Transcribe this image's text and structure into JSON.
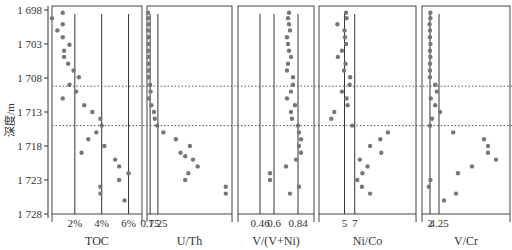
{
  "chart_data": {
    "type": "scatter",
    "ylabel": "深度/m",
    "y_ticks": [
      1698,
      1703,
      1708,
      1713,
      1718,
      1723,
      1728
    ],
    "y_tick_labels": [
      "1 698",
      "1 703",
      "1 708",
      "1 713",
      "1 718",
      "1 723",
      "1 728"
    ],
    "ylim": [
      1697.5,
      1728
    ],
    "y_inverted": true,
    "boundary_lines_depth": [
      1709.2,
      1715.0
    ],
    "depths": [
      1698.4,
      1699.2,
      1700.1,
      1701.0,
      1702.0,
      1703.0,
      1704.1,
      1705.0,
      1705.9,
      1706.9,
      1707.9,
      1709.0,
      1710.0,
      1711.0,
      1712.0,
      1713.0,
      1714.0,
      1715.0,
      1716.0,
      1717.0,
      1718.0,
      1719.0,
      1720.0,
      1721.0,
      1722.0,
      1723.0,
      1724.0,
      1725.0,
      1726.0
    ],
    "panels": [
      {
        "name": "TOC",
        "title": "TOC",
        "ref_lines": [
          2,
          4,
          6
        ],
        "ref_labels": [
          "2%",
          "4%",
          "6%"
        ],
        "xlim": [
          0.3,
          7.0
        ],
        "points": [
          {
            "d": 1698.4,
            "v": 1.1
          },
          {
            "d": 1699.2,
            "v": 0.3
          },
          {
            "d": 1700.1,
            "v": 1.1
          },
          {
            "d": 1701.0,
            "v": 0.7
          },
          {
            "d": 1702.0,
            "v": 1.1
          },
          {
            "d": 1703.1,
            "v": 1.6
          },
          {
            "d": 1704.0,
            "v": 1.2
          },
          {
            "d": 1704.9,
            "v": 1.2
          },
          {
            "d": 1705.9,
            "v": 1.5
          },
          {
            "d": 1706.9,
            "v": 1.9
          },
          {
            "d": 1707.9,
            "v": 2.3
          },
          {
            "d": 1709.0,
            "v": 1.6
          },
          {
            "d": 1710.0,
            "v": 2.1
          },
          {
            "d": 1711.0,
            "v": 1.1
          },
          {
            "d": 1712.0,
            "v": 2.7
          },
          {
            "d": 1713.0,
            "v": 3.3
          },
          {
            "d": 1714.0,
            "v": 3.9
          },
          {
            "d": 1715.0,
            "v": 4.0
          },
          {
            "d": 1716.0,
            "v": 3.6
          },
          {
            "d": 1717.0,
            "v": 3.0
          },
          {
            "d": 1718.0,
            "v": 4.2
          },
          {
            "d": 1719.0,
            "v": 2.5
          },
          {
            "d": 1720.0,
            "v": 5.0
          },
          {
            "d": 1721.0,
            "v": 5.3
          },
          {
            "d": 1722.0,
            "v": 6.0
          },
          {
            "d": 1723.0,
            "v": 5.3
          },
          {
            "d": 1724.0,
            "v": 3.9
          },
          {
            "d": 1725.0,
            "v": 3.9
          },
          {
            "d": 1726.0,
            "v": 5.7
          }
        ]
      },
      {
        "name": "U/Th",
        "title": "U/Th",
        "ref_lines": [
          0.75,
          1.25
        ],
        "ref_labels": [
          "0.75",
          "1.25"
        ],
        "xlim": [
          0.55,
          6.0
        ],
        "points": [
          {
            "d": 1698.4,
            "v": 0.62
          },
          {
            "d": 1699.2,
            "v": 0.62
          },
          {
            "d": 1700.1,
            "v": 0.63
          },
          {
            "d": 1701.0,
            "v": 0.63
          },
          {
            "d": 1702.0,
            "v": 0.64
          },
          {
            "d": 1703.0,
            "v": 0.64
          },
          {
            "d": 1704.0,
            "v": 0.63
          },
          {
            "d": 1704.9,
            "v": 0.64
          },
          {
            "d": 1705.9,
            "v": 0.66
          },
          {
            "d": 1706.9,
            "v": 0.65
          },
          {
            "d": 1707.9,
            "v": 0.66
          },
          {
            "d": 1709.0,
            "v": 0.75
          },
          {
            "d": 1710.0,
            "v": 0.78
          },
          {
            "d": 1711.0,
            "v": 0.68
          },
          {
            "d": 1712.0,
            "v": 0.83
          },
          {
            "d": 1713.0,
            "v": 1.0
          },
          {
            "d": 1714.0,
            "v": 1.05
          },
          {
            "d": 1715.0,
            "v": 1.2
          },
          {
            "d": 1716.0,
            "v": 1.6
          },
          {
            "d": 1717.0,
            "v": 2.4
          },
          {
            "d": 1718.0,
            "v": 3.3
          },
          {
            "d": 1719.0,
            "v": 2.7
          },
          {
            "d": 1719.5,
            "v": 3.0
          },
          {
            "d": 1720.0,
            "v": 3.5
          },
          {
            "d": 1721.0,
            "v": 3.8
          },
          {
            "d": 1722.0,
            "v": 3.2
          },
          {
            "d": 1723.0,
            "v": 3.0
          },
          {
            "d": 1724.0,
            "v": 5.6
          },
          {
            "d": 1725.0,
            "v": 5.6
          }
        ]
      },
      {
        "name": "V/(V+Ni)",
        "title": "V/(V+Ni)",
        "ref_lines": [
          0.46,
          0.6,
          0.84
        ],
        "ref_labels": [
          "0.46",
          "0.6",
          "0.84"
        ],
        "xlim": [
          0.24,
          1.0
        ],
        "points": [
          {
            "d": 1698.4,
            "v": 0.75
          },
          {
            "d": 1699.2,
            "v": 0.74
          },
          {
            "d": 1700.1,
            "v": 0.75
          },
          {
            "d": 1701.0,
            "v": 0.76
          },
          {
            "d": 1702.0,
            "v": 0.73
          },
          {
            "d": 1703.0,
            "v": 0.74
          },
          {
            "d": 1704.0,
            "v": 0.75
          },
          {
            "d": 1704.9,
            "v": 0.77
          },
          {
            "d": 1705.9,
            "v": 0.74
          },
          {
            "d": 1706.9,
            "v": 0.73
          },
          {
            "d": 1707.9,
            "v": 0.79
          },
          {
            "d": 1709.0,
            "v": 0.79
          },
          {
            "d": 1710.0,
            "v": 0.77
          },
          {
            "d": 1711.0,
            "v": 0.73
          },
          {
            "d": 1712.0,
            "v": 0.81
          },
          {
            "d": 1713.0,
            "v": 0.77
          },
          {
            "d": 1714.0,
            "v": 0.78
          },
          {
            "d": 1715.0,
            "v": 0.84
          },
          {
            "d": 1716.0,
            "v": 0.85
          },
          {
            "d": 1717.0,
            "v": 0.87
          },
          {
            "d": 1718.0,
            "v": 0.85
          },
          {
            "d": 1719.0,
            "v": 0.87
          },
          {
            "d": 1720.0,
            "v": 0.82
          },
          {
            "d": 1721.0,
            "v": 0.72
          },
          {
            "d": 1722.0,
            "v": 0.56
          },
          {
            "d": 1723.0,
            "v": 0.56
          },
          {
            "d": 1724.0,
            "v": 0.85
          },
          {
            "d": 1725.0,
            "v": 0.76
          }
        ]
      },
      {
        "name": "Ni/Co",
        "title": "Ni/Co",
        "ref_lines": [
          5,
          7
        ],
        "ref_labels": [
          "5",
          "7"
        ],
        "xlim": [
          0,
          19
        ],
        "points": [
          {
            "d": 1698.4,
            "v": 5.3
          },
          {
            "d": 1699.2,
            "v": 5.4
          },
          {
            "d": 1700.1,
            "v": 3.6
          },
          {
            "d": 1701.0,
            "v": 5.0
          },
          {
            "d": 1702.0,
            "v": 5.1
          },
          {
            "d": 1703.0,
            "v": 5.3
          },
          {
            "d": 1704.0,
            "v": 4.5
          },
          {
            "d": 1704.9,
            "v": 3.7
          },
          {
            "d": 1705.9,
            "v": 5.2
          },
          {
            "d": 1706.9,
            "v": 4.9
          },
          {
            "d": 1707.9,
            "v": 6.1
          },
          {
            "d": 1709.0,
            "v": 6.0
          },
          {
            "d": 1710.0,
            "v": 4.5
          },
          {
            "d": 1711.0,
            "v": 5.4
          },
          {
            "d": 1712.0,
            "v": 5.6
          },
          {
            "d": 1713.0,
            "v": 3.0
          },
          {
            "d": 1714.0,
            "v": 2.4
          },
          {
            "d": 1715.0,
            "v": 6.5
          },
          {
            "d": 1716.0,
            "v": 13.5
          },
          {
            "d": 1717.0,
            "v": 12.0
          },
          {
            "d": 1718.0,
            "v": 10.0
          },
          {
            "d": 1719.0,
            "v": 12.2
          },
          {
            "d": 1720.0,
            "v": 8.0
          },
          {
            "d": 1721.0,
            "v": 9.5
          },
          {
            "d": 1722.0,
            "v": 8.5
          },
          {
            "d": 1723.0,
            "v": 7.5
          },
          {
            "d": 1724.0,
            "v": 8.4
          },
          {
            "d": 1725.0,
            "v": 10.0
          }
        ]
      },
      {
        "name": "V/Cr",
        "title": "V/Cr",
        "ref_lines": [
          2,
          4.25
        ],
        "ref_labels": [
          "2",
          "4.25"
        ],
        "xlim": [
          0,
          22
        ],
        "points": [
          {
            "d": 1698.4,
            "v": 2.1
          },
          {
            "d": 1699.2,
            "v": 2.1
          },
          {
            "d": 1700.1,
            "v": 1.9
          },
          {
            "d": 1701.0,
            "v": 2.0
          },
          {
            "d": 1702.0,
            "v": 2.0
          },
          {
            "d": 1703.0,
            "v": 2.1
          },
          {
            "d": 1704.0,
            "v": 2.0
          },
          {
            "d": 1704.9,
            "v": 2.1
          },
          {
            "d": 1705.9,
            "v": 2.0
          },
          {
            "d": 1706.9,
            "v": 2.0
          },
          {
            "d": 1707.9,
            "v": 2.0
          },
          {
            "d": 1709.0,
            "v": 3.3
          },
          {
            "d": 1710.0,
            "v": 3.7
          },
          {
            "d": 1711.0,
            "v": 2.2
          },
          {
            "d": 1712.0,
            "v": 3.3
          },
          {
            "d": 1713.0,
            "v": 4.5
          },
          {
            "d": 1714.0,
            "v": 2.5
          },
          {
            "d": 1715.0,
            "v": 2.0
          },
          {
            "d": 1716.0,
            "v": 7.8
          },
          {
            "d": 1717.0,
            "v": 15.5
          },
          {
            "d": 1718.0,
            "v": 16.5
          },
          {
            "d": 1719.0,
            "v": 16.5
          },
          {
            "d": 1720.0,
            "v": 18.5
          },
          {
            "d": 1721.0,
            "v": 12.5
          },
          {
            "d": 1722.0,
            "v": 9.0
          },
          {
            "d": 1723.0,
            "v": 2.1
          },
          {
            "d": 1724.0,
            "v": 1.7
          },
          {
            "d": 1725.0,
            "v": 8.5
          },
          {
            "d": 1726.0,
            "v": 5.5
          }
        ]
      }
    ],
    "grid": false,
    "legend": "none"
  }
}
